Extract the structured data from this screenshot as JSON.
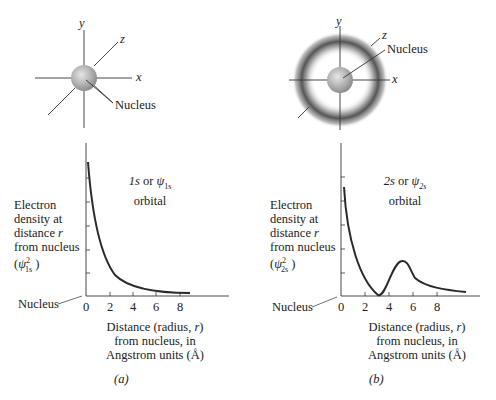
{
  "panel_a": {
    "axes_labels": {
      "x": "x",
      "y": "y",
      "z": "z"
    },
    "nucleus_label": "Nucleus",
    "orbital_label_line1": "1s or ψ1s",
    "orbital_label_line2": "orbital",
    "ylabel_lines": [
      "Electron",
      "density at",
      "distance r",
      "from nucleus",
      "(ψ²1s )"
    ],
    "x_ticks": [
      "0",
      "2",
      "4",
      "6",
      "8"
    ],
    "xlabel_lines": [
      "Distance (radius, r)",
      "from nucleus, in",
      "Angstrom units (Å)"
    ],
    "nucleus_axis_label": "Nucleus",
    "caption": "(a)"
  },
  "panel_b": {
    "axes_labels": {
      "x": "x",
      "y": "y",
      "z": "z"
    },
    "nucleus_label": "Nucleus",
    "orbital_label_line1": "2s or ψ2s",
    "orbital_label_line2": "orbital",
    "ylabel_lines": [
      "Electron",
      "density at",
      "distance r",
      "from nucleus",
      "(ψ²2s )"
    ],
    "x_ticks": [
      "0",
      "2",
      "4",
      "6",
      "8"
    ],
    "xlabel_lines": [
      "Distance (radius, r)",
      "from nucleus, in",
      "Angstrom units (Å)"
    ],
    "nucleus_axis_label": "Nucleus",
    "caption": "(b)"
  },
  "colors": {
    "ink": "#2a2a2a",
    "sphere": "#b8b8b8",
    "shell": "#555555"
  }
}
